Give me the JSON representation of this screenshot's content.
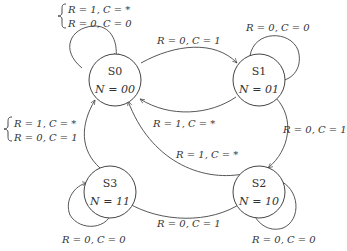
{
  "diagram": {
    "type": "state-machine",
    "states": [
      {
        "id": "S0",
        "name": "S0",
        "output": "N = 00"
      },
      {
        "id": "S1",
        "name": "S1",
        "output": "N = 01"
      },
      {
        "id": "S2",
        "name": "S2",
        "output": "N = 10"
      },
      {
        "id": "S3",
        "name": "S3",
        "output": "N = 11"
      }
    ],
    "transitions": [
      {
        "from": "S0",
        "to": "S0",
        "labels": [
          "R = 1,  C = *",
          "R = 0,  C = 0"
        ]
      },
      {
        "from": "S0",
        "to": "S1",
        "labels": [
          "R = 0,  C = 1"
        ]
      },
      {
        "from": "S1",
        "to": "S1",
        "labels": [
          "R = 0,  C = 0"
        ]
      },
      {
        "from": "S1",
        "to": "S0",
        "labels": [
          "R = 1,  C = *"
        ]
      },
      {
        "from": "S1",
        "to": "S2",
        "labels": [
          "R = 0,  C = 1"
        ]
      },
      {
        "from": "S2",
        "to": "S0",
        "labels": [
          "R = 1,  C = *"
        ]
      },
      {
        "from": "S2",
        "to": "S2",
        "labels": [
          "R = 0,  C = 0"
        ]
      },
      {
        "from": "S2",
        "to": "S3",
        "labels": [
          "R = 0,  C = 1"
        ]
      },
      {
        "from": "S3",
        "to": "S0",
        "labels": [
          "R = 1,  C = *",
          "R = 0,  C = 1"
        ]
      },
      {
        "from": "S3",
        "to": "S3",
        "labels": [
          "R = 0,  C = 0"
        ]
      }
    ]
  },
  "labels": {
    "s0_self_1": "R = 1,  C = *",
    "s0_self_2": "R = 0,  C = 0",
    "s0_to_s1": "R = 0,  C = 1",
    "s1_self": "R = 0,  C = 0",
    "s1_to_s0": "R = 1,  C = *",
    "s1_to_s2": "R = 0,  C = 1",
    "s2_to_s0": "R = 1,  C = *",
    "s2_self": "R = 0,  C = 0",
    "s2_to_s3": "R = 0,  C = 1",
    "s3_to_s0_1": "R = 1,  C = *",
    "s3_to_s0_2": "R = 0,  C = 1",
    "s3_self": "R = 0,  C = 0"
  },
  "nodes": {
    "s0": {
      "name": "S0",
      "output": "N = 00"
    },
    "s1": {
      "name": "S1",
      "output": "N = 01"
    },
    "s2": {
      "name": "S2",
      "output": "N = 10"
    },
    "s3": {
      "name": "S3",
      "output": "N = 11"
    }
  }
}
